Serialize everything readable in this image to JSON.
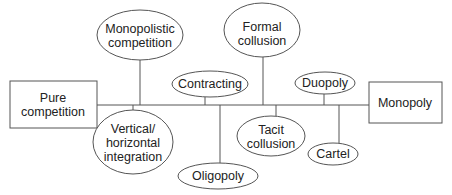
{
  "diagram": {
    "type": "market-structure-spectrum",
    "colors": {
      "stroke": "#555555",
      "text": "#222222",
      "background": "#ffffff"
    },
    "endpoints": {
      "left": {
        "label": "Pure\ncompetition"
      },
      "right": {
        "label": "Monopoly"
      }
    },
    "nodes": {
      "monopolistic_competition": {
        "label": "Monopolistic\ncompetition"
      },
      "formal_collusion": {
        "label": "Formal\ncollusion"
      },
      "contracting": {
        "label": "Contracting"
      },
      "duopoly": {
        "label": "Duopoly"
      },
      "vertical_horizontal_integration": {
        "label": "Vertical/\nhorizontal\nintegration"
      },
      "oligopoly": {
        "label": "Oligopoly"
      },
      "tacit_collusion": {
        "label": "Tacit\ncollusion"
      },
      "cartel": {
        "label": "Cartel"
      }
    }
  }
}
